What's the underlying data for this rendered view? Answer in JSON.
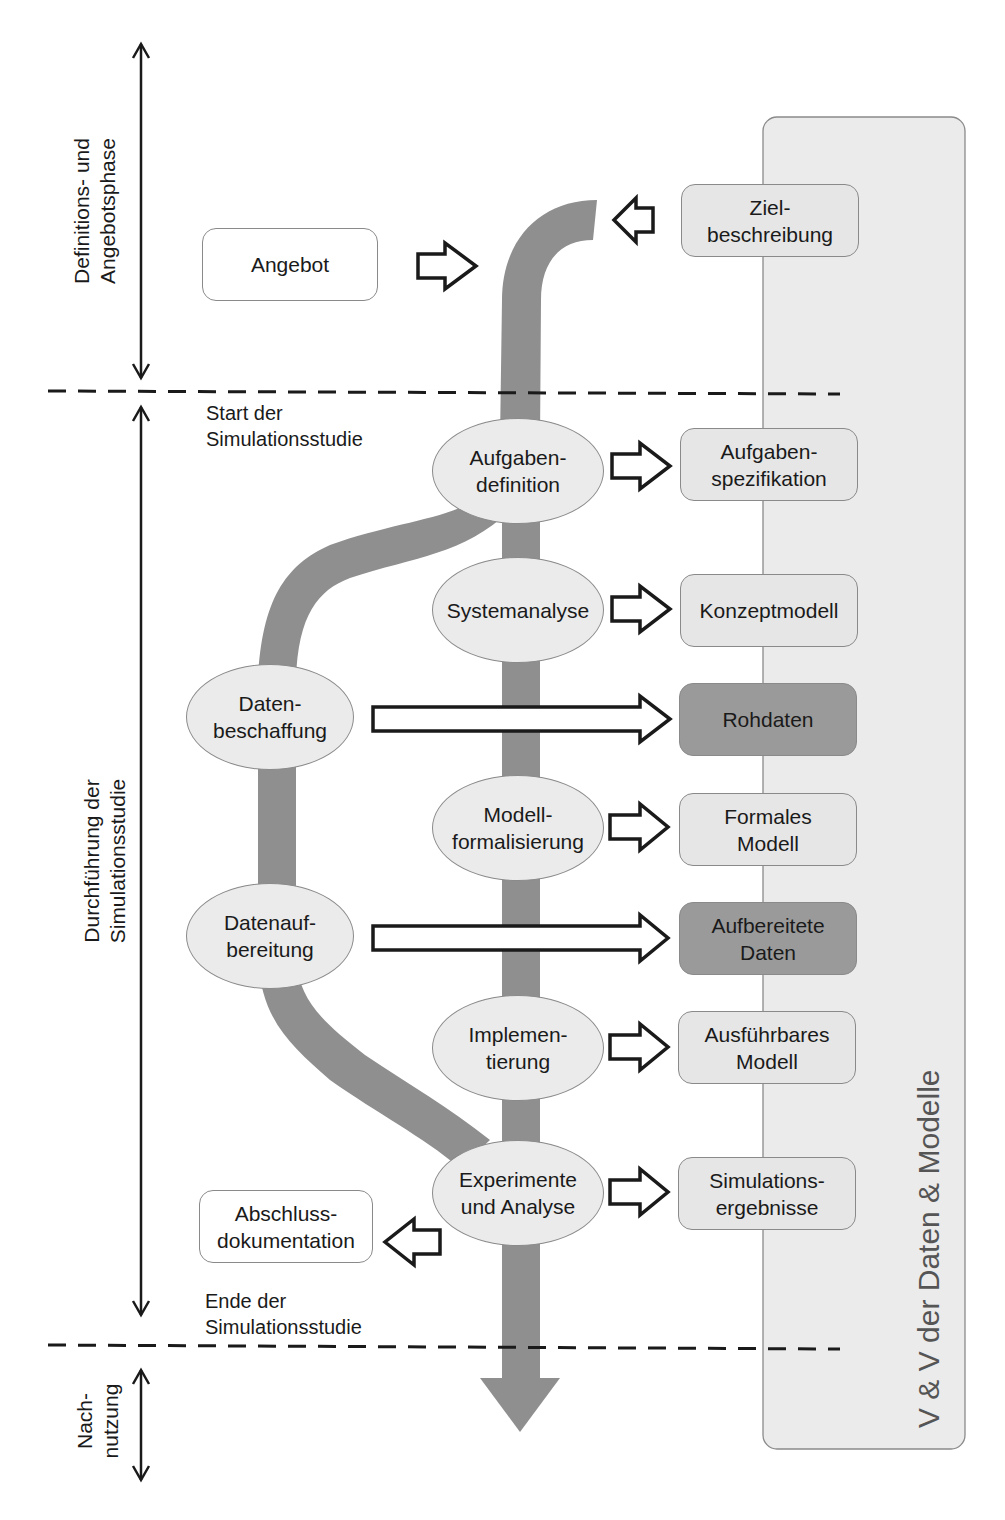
{
  "diagram": {
    "phases": [
      {
        "label": "Definitions- und\nAngebotsphase"
      },
      {
        "label": "Durchführung der\nSimulationsstudie"
      },
      {
        "label": "Nach-\nnutzung"
      }
    ],
    "milestones": {
      "start": "Start der\nSimulationsstudie",
      "end": "Ende der\nSimulationsstudie"
    },
    "side_panel": {
      "label": "V & V der Daten & Modelle"
    },
    "inputs": {
      "angebot": "Angebot",
      "zielbeschreibung": "Ziel-\nbeschreibung"
    },
    "process_steps": [
      {
        "id": "aufgabendefinition",
        "label": "Aufgaben-\ndefinition"
      },
      {
        "id": "systemanalyse",
        "label": "Systemanalyse"
      },
      {
        "id": "datenbeschaffung",
        "label": "Daten-\nbeschaffung"
      },
      {
        "id": "modellformalisierung",
        "label": "Modell-\nformalisierung"
      },
      {
        "id": "datenaufbereitung",
        "label": "Datenauf-\nbereitung"
      },
      {
        "id": "implementierung",
        "label": "Implemen-\ntierung"
      },
      {
        "id": "experimente",
        "label": "Experimente\nund Analyse"
      }
    ],
    "results": [
      {
        "id": "aufgabenspezifikation",
        "label": "Aufgaben-\nspezifikation",
        "shade": "light"
      },
      {
        "id": "konzeptmodell",
        "label": "Konzeptmodell",
        "shade": "light"
      },
      {
        "id": "rohdaten",
        "label": "Rohdaten",
        "shade": "dark"
      },
      {
        "id": "formales-modell",
        "label": "Formales\nModell",
        "shade": "light"
      },
      {
        "id": "aufbereitete-daten",
        "label": "Aufbereitete\nDaten",
        "shade": "dark"
      },
      {
        "id": "ausfuehrbares-modell",
        "label": "Ausführbares\nModell",
        "shade": "light"
      },
      {
        "id": "simulationsergebnisse",
        "label": "Simulations-\nergebnisse",
        "shade": "light"
      }
    ],
    "outputs": {
      "abschlussdokumentation": "Abschluss-\ndokumentation"
    },
    "colors": {
      "flow": "#8f8f8f",
      "panel": "#ebebeb",
      "light_box": "#e6e6e6",
      "dark_box": "#9a9a9a",
      "ellipse": "#ebebeb",
      "line": "#1a1a1a"
    }
  }
}
